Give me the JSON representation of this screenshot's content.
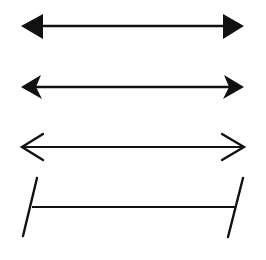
{
  "diagram": {
    "title": "",
    "background": "#ffffff",
    "stroke_color": "#111111",
    "items": [
      {
        "name": "double-arrow-solid-triangle-heads",
        "style": "filled triangular arrowheads",
        "y": 26,
        "x_start": 21,
        "x_end": 244
      },
      {
        "name": "double-arrow-notched-heads",
        "style": "filled barbed (notched) arrowheads",
        "y": 87,
        "x_start": 21,
        "x_end": 244
      },
      {
        "name": "double-arrow-open-heads",
        "style": "open chevron arrowheads",
        "y": 147,
        "x_start": 21,
        "x_end": 245
      },
      {
        "name": "line-segment-slanted-end-bars",
        "style": "horizontal segment with slanted perpendicular end bars",
        "y": 207,
        "x_start": 32,
        "x_end": 235
      }
    ]
  }
}
